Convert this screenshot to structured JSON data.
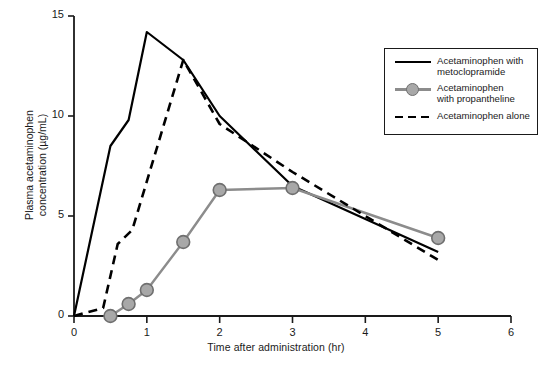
{
  "chart_data": {
    "type": "line",
    "title": "",
    "xlabel": "Time after administration (hr)",
    "ylabel": "Plasma acetaminophen concentration (µg/mL)",
    "ylabel_line1": "Plasma acetaminophen",
    "ylabel_line2": "concentration (µg/mL)",
    "xlim": [
      0,
      6
    ],
    "ylim": [
      0,
      15
    ],
    "xticks": [
      "0",
      "1",
      "2",
      "3",
      "4",
      "5",
      "6"
    ],
    "xtick_values": [
      0,
      1,
      2,
      3,
      4,
      5,
      6
    ],
    "yticks": [
      "0",
      "5",
      "10",
      "15"
    ],
    "ytick_values": [
      0,
      5,
      10,
      15
    ],
    "grid": false,
    "legend_position": "upper right",
    "series": [
      {
        "name": "Acetaminophen with metoclopramide",
        "style": "solid",
        "color": "#000000",
        "markers": false,
        "x": [
          0,
          0.5,
          0.75,
          1.0,
          1.5,
          2.0,
          3.0,
          5.0
        ],
        "y": [
          0,
          8.5,
          9.8,
          14.2,
          12.8,
          10.0,
          6.5,
          3.2
        ]
      },
      {
        "name": "Acetaminophen with propantheline",
        "style": "solid-markers",
        "color": "#8c8c8c",
        "markers": true,
        "x": [
          0.5,
          0.75,
          1.0,
          1.5,
          2.0,
          3.0,
          5.0
        ],
        "y": [
          0.0,
          0.6,
          1.3,
          3.7,
          6.3,
          6.4,
          3.9
        ]
      },
      {
        "name": "Acetaminophen alone",
        "style": "dashed",
        "color": "#000000",
        "markers": false,
        "x": [
          0,
          0.4,
          0.6,
          0.8,
          1.5,
          2.0,
          3.0,
          5.0
        ],
        "y": [
          0,
          0.4,
          3.6,
          4.3,
          12.8,
          9.6,
          7.2,
          2.8
        ]
      }
    ]
  },
  "legend": {
    "entries": [
      {
        "label_line1": "Acetaminophen with",
        "label_line2": "metoclopramide",
        "symbol": "solid-line-icon"
      },
      {
        "label_line1": "Acetaminophen",
        "label_line2": "with propantheline",
        "symbol": "gray-line-marker-icon"
      },
      {
        "label_line1": "Acetaminophen alone",
        "label_line2": "",
        "symbol": "dashed-line-icon"
      }
    ]
  },
  "colors": {
    "axis": "#1a1a1a",
    "solid_series": "#000000",
    "marker_series": "#8c8c8c",
    "marker_fill": "#a8a8a8",
    "marker_edge": "#6f6f6f",
    "background": "#ffffff"
  }
}
